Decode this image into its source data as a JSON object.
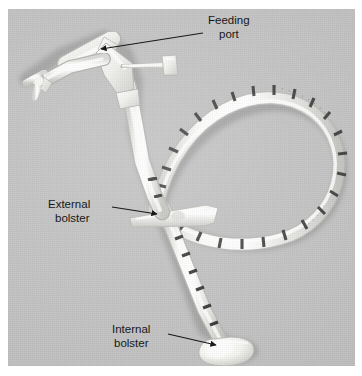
{
  "figure": {
    "plate": {
      "background_color": "#c0c0c0",
      "border_color": "#ffffff",
      "x": 8,
      "y": 9,
      "width": 347,
      "height": 357
    },
    "device_color": "#f2f2ef",
    "annotation_color": "#181818"
  },
  "annotations": [
    {
      "id": "feeding-port",
      "line1": "Feeding",
      "line2": "port",
      "text_x": 208,
      "text_y": 24,
      "arrow": {
        "x1": 203,
        "y1": 33,
        "x2": 101,
        "y2": 49
      }
    },
    {
      "id": "external-bolster",
      "line1": "External",
      "line2": "bolster",
      "text_x": 48,
      "text_y": 208,
      "arrow": {
        "x1": 112,
        "y1": 207,
        "x2": 157,
        "y2": 214
      }
    },
    {
      "id": "internal-bolster",
      "line1": "Internal",
      "line2": "bolster",
      "text_x": 112,
      "text_y": 333,
      "arrow": {
        "x1": 168,
        "y1": 334,
        "x2": 216,
        "y2": 345
      }
    }
  ],
  "device_parts": [
    {
      "name": "end-cap-plug",
      "description": "small cruciform plug at free end of side limb"
    },
    {
      "name": "side-limb",
      "description": "angled limb running down-left from the Y hub"
    },
    {
      "name": "feeding-port-limb",
      "description": "upper limb of Y hub, target of feeding port label"
    },
    {
      "name": "y-hub",
      "description": "Y shaped connector body"
    },
    {
      "name": "secondary-port-arm",
      "description": "short horizontal arm with end cap on right of hub"
    },
    {
      "name": "shaft-upper",
      "description": "tube descending from hub toward bolster"
    },
    {
      "name": "tube-loop",
      "description": "large coiled loop of graduated tubing to the right"
    },
    {
      "name": "external-bolster-disc",
      "description": "flat external retention disc on shaft"
    },
    {
      "name": "shaft-lower",
      "description": "graduated tube below external bolster"
    },
    {
      "name": "internal-bolster-dome",
      "description": "mushroom shaped internal retention bolster"
    }
  ]
}
